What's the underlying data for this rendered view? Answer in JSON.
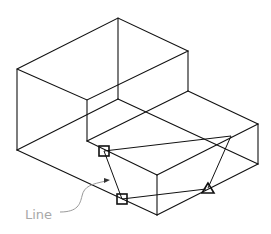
{
  "diagram": {
    "type": "isometric-wireframe",
    "annotation": {
      "label": "Line",
      "color": "#a8a8a8"
    },
    "markers": [
      {
        "shape": "square",
        "name": "point-a"
      },
      {
        "shape": "square",
        "name": "point-b"
      },
      {
        "shape": "triangle",
        "name": "point-c"
      }
    ],
    "colors": {
      "edges": "#111111",
      "leader": "#999999",
      "background": "#ffffff"
    }
  }
}
